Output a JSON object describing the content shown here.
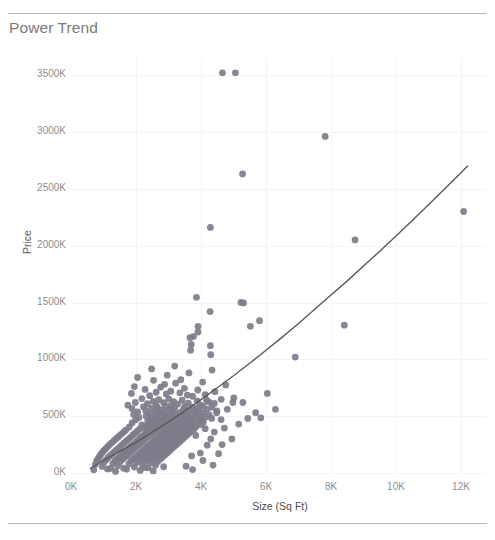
{
  "card": {
    "title": "Power Trend",
    "clipped_top_text": "",
    "title_color": "#7a7a7a",
    "rule_color": "#b9b9b9",
    "background": "#ffffff"
  },
  "chart_data": {
    "type": "scatter",
    "title": "Power Trend",
    "xlabel": "Size (Sq Ft)",
    "ylabel": "Price",
    "grid": true,
    "legend": false,
    "mark_color": "#7d7d8a",
    "trendline_color": "#5a5a5a",
    "trendline_type": "power",
    "xlim": [
      0,
      12800
    ],
    "ylim": [
      0,
      3650000
    ],
    "xticks": [
      0,
      2000,
      4000,
      6000,
      8000,
      10000,
      12000
    ],
    "xticklabels": [
      "0K",
      "2K",
      "4K",
      "6K",
      "8K",
      "10K",
      "12K"
    ],
    "yticks": [
      0,
      500000,
      1000000,
      1500000,
      2000000,
      2500000,
      3000000,
      3500000
    ],
    "yticklabels": [
      "0K",
      "500K",
      "1000K",
      "1500K",
      "2000K",
      "2500K",
      "3000K",
      "3500K"
    ],
    "trendline": [
      [
        600,
        40000
      ],
      [
        1000,
        110000
      ],
      [
        1500,
        190000
      ],
      [
        2000,
        270000
      ],
      [
        2500,
        360000
      ],
      [
        3000,
        450000
      ],
      [
        3500,
        545000
      ],
      [
        4000,
        645000
      ],
      [
        4500,
        750000
      ],
      [
        5000,
        855000
      ],
      [
        5500,
        965000
      ],
      [
        6000,
        1080000
      ],
      [
        6500,
        1195000
      ],
      [
        7000,
        1315000
      ],
      [
        7500,
        1440000
      ],
      [
        8000,
        1565000
      ],
      [
        8500,
        1690000
      ],
      [
        9000,
        1820000
      ],
      [
        9500,
        1950000
      ],
      [
        10000,
        2085000
      ],
      [
        10500,
        2220000
      ],
      [
        11000,
        2360000
      ],
      [
        11500,
        2500000
      ],
      [
        12000,
        2640000
      ],
      [
        12200,
        2700000
      ]
    ],
    "points": [
      [
        4660,
        3520000
      ],
      [
        5060,
        3520000
      ],
      [
        7820,
        2960000
      ],
      [
        5280,
        2630000
      ],
      [
        12080,
        2300000
      ],
      [
        4290,
        2160000
      ],
      [
        8740,
        2050000
      ],
      [
        3860,
        1545000
      ],
      [
        5230,
        1500000
      ],
      [
        5310,
        1495000
      ],
      [
        4280,
        1420000
      ],
      [
        5800,
        1340000
      ],
      [
        8410,
        1300000
      ],
      [
        3910,
        1290000
      ],
      [
        5520,
        1290000
      ],
      [
        3905,
        1240000
      ],
      [
        3770,
        1200000
      ],
      [
        3660,
        1190000
      ],
      [
        3700,
        1130000
      ],
      [
        4290,
        1120000
      ],
      [
        3680,
        1080000
      ],
      [
        4300,
        1040000
      ],
      [
        6900,
        1020000
      ],
      [
        3190,
        940000
      ],
      [
        2480,
        915000
      ],
      [
        4340,
        905000
      ],
      [
        3630,
        880000
      ],
      [
        2960,
        860000
      ],
      [
        2050,
        840000
      ],
      [
        3380,
        820000
      ],
      [
        2540,
        815000
      ],
      [
        4050,
        800000
      ],
      [
        3220,
        790000
      ],
      [
        2880,
        780000
      ],
      [
        4760,
        775000
      ],
      [
        1950,
        760000
      ],
      [
        2760,
        755000
      ],
      [
        3490,
        745000
      ],
      [
        2280,
        735000
      ],
      [
        3900,
        730000
      ],
      [
        3070,
        720000
      ],
      [
        4430,
        715000
      ],
      [
        2620,
        710000
      ],
      [
        3350,
        705000
      ],
      [
        1860,
        700000
      ],
      [
        2930,
        695000
      ],
      [
        4130,
        690000
      ],
      [
        3580,
        685000
      ],
      [
        2420,
        680000
      ],
      [
        3740,
        675000
      ],
      [
        5010,
        660000
      ],
      [
        2180,
        655000
      ],
      [
        3010,
        650000
      ],
      [
        4620,
        648000
      ],
      [
        2700,
        645000
      ],
      [
        3420,
        640000
      ],
      [
        3880,
        635000
      ],
      [
        2530,
        630000
      ],
      [
        3160,
        628000
      ],
      [
        4240,
        625000
      ],
      [
        1980,
        620000
      ],
      [
        2850,
        618000
      ],
      [
        3610,
        615000
      ],
      [
        4410,
        612000
      ],
      [
        2350,
        610000
      ],
      [
        3280,
        606000
      ],
      [
        3960,
        602000
      ],
      [
        2620,
        600000
      ],
      [
        1750,
        596000
      ],
      [
        3080,
        593000
      ],
      [
        4060,
        590000
      ],
      [
        2910,
        588000
      ],
      [
        3500,
        585000
      ],
      [
        2230,
        582000
      ],
      [
        3740,
        580000
      ],
      [
        4330,
        578000
      ],
      [
        2660,
        575000
      ],
      [
        3190,
        572000
      ],
      [
        3880,
        570000
      ],
      [
        2480,
        568000
      ],
      [
        1880,
        565000
      ],
      [
        3020,
        562000
      ],
      [
        4180,
        560000
      ],
      [
        3450,
        558000
      ],
      [
        2790,
        555000
      ],
      [
        3640,
        552000
      ],
      [
        2300,
        550000
      ],
      [
        3930,
        548000
      ],
      [
        4490,
        546000
      ],
      [
        2590,
        544000
      ],
      [
        3130,
        542000
      ],
      [
        3780,
        540000
      ],
      [
        2050,
        538000
      ],
      [
        2930,
        535000
      ],
      [
        3360,
        532000
      ],
      [
        4060,
        530000
      ],
      [
        2710,
        528000
      ],
      [
        3540,
        525000
      ],
      [
        2420,
        523000
      ],
      [
        3850,
        520000
      ],
      [
        3210,
        518000
      ],
      [
        2860,
        516000
      ],
      [
        1930,
        514000
      ],
      [
        4250,
        512000
      ],
      [
        3470,
        510000
      ],
      [
        2640,
        508000
      ],
      [
        3090,
        506000
      ],
      [
        3720,
        504000
      ],
      [
        2310,
        502000
      ],
      [
        3980,
        500000
      ],
      [
        2880,
        498000
      ],
      [
        3330,
        496000
      ],
      [
        2520,
        494000
      ],
      [
        3600,
        492000
      ],
      [
        4140,
        490000
      ],
      [
        2090,
        488000
      ],
      [
        2960,
        486000
      ],
      [
        3420,
        484000
      ],
      [
        3820,
        482000
      ],
      [
        2700,
        480000
      ],
      [
        3180,
        478000
      ],
      [
        2450,
        476000
      ],
      [
        3560,
        474000
      ],
      [
        4020,
        472000
      ],
      [
        2840,
        470000
      ],
      [
        1990,
        468000
      ],
      [
        3270,
        466000
      ],
      [
        3690,
        464000
      ],
      [
        2610,
        462000
      ],
      [
        3090,
        460000
      ],
      [
        2360,
        458000
      ],
      [
        3450,
        456000
      ],
      [
        3900,
        454000
      ],
      [
        2780,
        452000
      ],
      [
        3220,
        450000
      ],
      [
        2510,
        448000
      ],
      [
        3620,
        446000
      ],
      [
        4070,
        444000
      ],
      [
        2930,
        442000
      ],
      [
        1880,
        440000
      ],
      [
        3350,
        438000
      ],
      [
        3760,
        436000
      ],
      [
        2680,
        434000
      ],
      [
        3130,
        432000
      ],
      [
        2420,
        430000
      ],
      [
        3530,
        428000
      ],
      [
        3980,
        426000
      ],
      [
        2860,
        424000
      ],
      [
        2180,
        422000
      ],
      [
        3290,
        420000
      ],
      [
        3700,
        418000
      ],
      [
        2590,
        416000
      ],
      [
        3060,
        414000
      ],
      [
        2330,
        412000
      ],
      [
        3460,
        410000
      ],
      [
        3850,
        408000
      ],
      [
        2750,
        406000
      ],
      [
        1790,
        404000
      ],
      [
        3200,
        402000
      ],
      [
        3630,
        400000
      ],
      [
        2500,
        398000
      ],
      [
        2980,
        396000
      ],
      [
        2260,
        394000
      ],
      [
        3390,
        392000
      ],
      [
        3790,
        390000
      ],
      [
        2660,
        388000
      ],
      [
        2110,
        386000
      ],
      [
        3140,
        384000
      ],
      [
        3560,
        382000
      ],
      [
        2430,
        380000
      ],
      [
        2900,
        378000
      ],
      [
        1680,
        376000
      ],
      [
        3320,
        374000
      ],
      [
        3720,
        372000
      ],
      [
        2580,
        370000
      ],
      [
        2040,
        368000
      ],
      [
        3070,
        366000
      ],
      [
        3490,
        364000
      ],
      [
        2350,
        362000
      ],
      [
        2830,
        360000
      ],
      [
        1610,
        358000
      ],
      [
        3250,
        356000
      ],
      [
        3650,
        354000
      ],
      [
        2500,
        352000
      ],
      [
        1970,
        350000
      ],
      [
        3000,
        348000
      ],
      [
        3420,
        346000
      ],
      [
        2280,
        344000
      ],
      [
        2760,
        342000
      ],
      [
        1540,
        340000
      ],
      [
        3180,
        338000
      ],
      [
        3580,
        336000
      ],
      [
        2430,
        334000
      ],
      [
        1900,
        332000
      ],
      [
        2930,
        330000
      ],
      [
        3350,
        328000
      ],
      [
        2200,
        326000
      ],
      [
        2690,
        324000
      ],
      [
        1470,
        322000
      ],
      [
        3110,
        320000
      ],
      [
        3510,
        318000
      ],
      [
        2350,
        316000
      ],
      [
        1830,
        314000
      ],
      [
        2860,
        312000
      ],
      [
        3280,
        310000
      ],
      [
        2130,
        308000
      ],
      [
        2620,
        306000
      ],
      [
        1400,
        304000
      ],
      [
        3040,
        302000
      ],
      [
        3440,
        300000
      ],
      [
        2280,
        298000
      ],
      [
        1760,
        296000
      ],
      [
        2790,
        294000
      ],
      [
        3210,
        292000
      ],
      [
        2060,
        290000
      ],
      [
        2550,
        288000
      ],
      [
        1330,
        286000
      ],
      [
        2970,
        284000
      ],
      [
        3370,
        282000
      ],
      [
        2210,
        280000
      ],
      [
        1690,
        278000
      ],
      [
        2720,
        276000
      ],
      [
        3140,
        274000
      ],
      [
        1990,
        272000
      ],
      [
        2480,
        270000
      ],
      [
        1260,
        268000
      ],
      [
        2900,
        266000
      ],
      [
        3300,
        264000
      ],
      [
        2140,
        262000
      ],
      [
        1620,
        260000
      ],
      [
        2650,
        258000
      ],
      [
        3070,
        256000
      ],
      [
        1920,
        254000
      ],
      [
        2410,
        252000
      ],
      [
        1190,
        250000
      ],
      [
        2830,
        248000
      ],
      [
        3230,
        246000
      ],
      [
        2070,
        244000
      ],
      [
        1550,
        242000
      ],
      [
        2580,
        240000
      ],
      [
        3000,
        238000
      ],
      [
        1850,
        236000
      ],
      [
        2340,
        234000
      ],
      [
        1130,
        232000
      ],
      [
        2760,
        230000
      ],
      [
        3160,
        228000
      ],
      [
        2000,
        226000
      ],
      [
        1480,
        224000
      ],
      [
        2510,
        222000
      ],
      [
        2930,
        220000
      ],
      [
        1780,
        218000
      ],
      [
        2270,
        216000
      ],
      [
        1070,
        214000
      ],
      [
        2690,
        212000
      ],
      [
        3090,
        210000
      ],
      [
        1930,
        208000
      ],
      [
        1410,
        206000
      ],
      [
        2440,
        204000
      ],
      [
        2860,
        202000
      ],
      [
        1710,
        200000
      ],
      [
        2200,
        198000
      ],
      [
        1010,
        196000
      ],
      [
        2620,
        194000
      ],
      [
        3020,
        192000
      ],
      [
        1860,
        190000
      ],
      [
        1340,
        188000
      ],
      [
        2370,
        186000
      ],
      [
        2790,
        184000
      ],
      [
        1640,
        182000
      ],
      [
        2130,
        180000
      ],
      [
        960,
        178000
      ],
      [
        2550,
        176000
      ],
      [
        2950,
        174000
      ],
      [
        1790,
        172000
      ],
      [
        1270,
        170000
      ],
      [
        2300,
        168000
      ],
      [
        2720,
        166000
      ],
      [
        1570,
        164000
      ],
      [
        2060,
        162000
      ],
      [
        910,
        160000
      ],
      [
        2480,
        158000
      ],
      [
        2880,
        156000
      ],
      [
        1720,
        154000
      ],
      [
        1200,
        152000
      ],
      [
        2230,
        150000
      ],
      [
        2650,
        148000
      ],
      [
        1500,
        146000
      ],
      [
        1990,
        144000
      ],
      [
        870,
        142000
      ],
      [
        2410,
        140000
      ],
      [
        2810,
        138000
      ],
      [
        1650,
        136000
      ],
      [
        1140,
        134000
      ],
      [
        2160,
        132000
      ],
      [
        2580,
        130000
      ],
      [
        1430,
        128000
      ],
      [
        1920,
        126000
      ],
      [
        830,
        124000
      ],
      [
        2340,
        122000
      ],
      [
        2740,
        120000
      ],
      [
        1580,
        118000
      ],
      [
        1080,
        116000
      ],
      [
        2090,
        114000
      ],
      [
        2510,
        112000
      ],
      [
        1360,
        110000
      ],
      [
        1850,
        108000
      ],
      [
        790,
        106000
      ],
      [
        2270,
        104000
      ],
      [
        2670,
        102000
      ],
      [
        1510,
        100000
      ],
      [
        1020,
        96000
      ],
      [
        2020,
        92000
      ],
      [
        2440,
        88000
      ],
      [
        1290,
        84000
      ],
      [
        1780,
        80000
      ],
      [
        750,
        76000
      ],
      [
        2200,
        72000
      ],
      [
        2600,
        68000
      ],
      [
        1440,
        64000
      ],
      [
        960,
        58000
      ],
      [
        1950,
        52000
      ],
      [
        2370,
        46000
      ],
      [
        1220,
        40000
      ],
      [
        1710,
        34000
      ],
      [
        700,
        28000
      ],
      [
        2130,
        22000
      ],
      [
        2530,
        18000
      ],
      [
        1370,
        14000
      ],
      [
        3740,
        30000
      ],
      [
        4330,
        480000
      ],
      [
        4620,
        470000
      ],
      [
        4480,
        530000
      ],
      [
        4810,
        560000
      ],
      [
        4980,
        620000
      ],
      [
        5160,
        430000
      ],
      [
        4720,
        395000
      ],
      [
        4410,
        360000
      ],
      [
        5440,
        480000
      ],
      [
        5680,
        530000
      ],
      [
        4950,
        300000
      ],
      [
        4190,
        245000
      ],
      [
        3980,
        175000
      ],
      [
        4060,
        110000
      ],
      [
        4370,
        70000
      ],
      [
        4540,
        170000
      ],
      [
        4170,
        640000
      ],
      [
        3840,
        330000
      ],
      [
        4300,
        300000
      ],
      [
        4130,
        390000
      ],
      [
        4650,
        250000
      ],
      [
        3710,
        150000
      ],
      [
        5290,
        620000
      ],
      [
        6040,
        700000
      ],
      [
        5840,
        485000
      ],
      [
        6290,
        560000
      ],
      [
        3540,
        60000
      ],
      [
        2850,
        55000
      ],
      [
        2270,
        48000
      ],
      [
        1620,
        42000
      ],
      [
        1120,
        36000
      ]
    ]
  }
}
